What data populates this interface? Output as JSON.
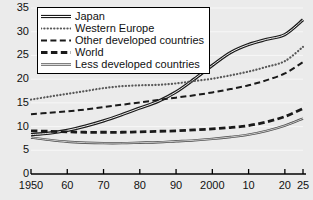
{
  "chart_data": {
    "type": "line",
    "title": "",
    "subtitle": "",
    "xlabel": "",
    "ylabel": "",
    "xlim": [
      1950,
      2025
    ],
    "ylim": [
      0,
      35
    ],
    "grid": true,
    "legend_position": "top-left",
    "y_ticks": [
      0,
      5,
      10,
      15,
      20,
      25,
      30,
      35
    ],
    "y_tick_labels": [
      "0",
      "5",
      "10",
      "15",
      "20",
      "25",
      "30",
      "35"
    ],
    "x_ticks": [
      1950,
      1960,
      1970,
      1980,
      1990,
      2000,
      2010,
      2020,
      2025
    ],
    "x_tick_labels": [
      "1950",
      "60",
      "70",
      "80",
      "90",
      "2000",
      "10",
      "20",
      "25"
    ],
    "x": [
      1950,
      1955,
      1960,
      1965,
      1970,
      1975,
      1980,
      1985,
      1990,
      1995,
      2000,
      2005,
      2010,
      2015,
      2020,
      2025
    ],
    "series": [
      {
        "name": "Japan",
        "style": "double-solid",
        "color": "#1a1a1a",
        "values": [
          8.3,
          8.6,
          9.2,
          10.1,
          11.2,
          12.5,
          13.9,
          15.3,
          17.3,
          20.0,
          22.9,
          25.6,
          27.3,
          28.4,
          29.4,
          32.5
        ]
      },
      {
        "name": "Western Europe",
        "style": "dotted",
        "color": "#4d4d4d",
        "values": [
          15.7,
          16.3,
          16.9,
          17.5,
          18.1,
          18.5,
          18.7,
          18.8,
          19.1,
          19.6,
          20.1,
          20.8,
          21.6,
          22.6,
          23.8,
          26.8
        ]
      },
      {
        "name": "Other developed countries",
        "style": "dashed",
        "color": "#1a1a1a",
        "values": [
          12.6,
          12.9,
          13.2,
          13.6,
          14.1,
          14.6,
          15.1,
          15.6,
          16.1,
          16.6,
          17.2,
          17.9,
          18.7,
          19.8,
          21.2,
          23.6
        ]
      },
      {
        "name": "World",
        "style": "thick-dashed",
        "color": "#1a1a1a",
        "values": [
          9.1,
          9.0,
          8.9,
          8.8,
          8.8,
          8.8,
          8.9,
          9.0,
          9.1,
          9.3,
          9.5,
          9.8,
          10.2,
          11.0,
          12.1,
          13.8
        ]
      },
      {
        "name": "Less developed countries",
        "style": "double-thin",
        "color": "#4d4d4d",
        "values": [
          7.7,
          7.2,
          6.8,
          6.6,
          6.5,
          6.5,
          6.6,
          6.7,
          6.9,
          7.1,
          7.4,
          7.8,
          8.3,
          9.1,
          10.2,
          11.7
        ]
      }
    ]
  },
  "legend": {
    "items": [
      {
        "label": "Japan",
        "style": "double-solid"
      },
      {
        "label": "Western Europe",
        "style": "dotted"
      },
      {
        "label": "Other developed countries",
        "style": "dashed"
      },
      {
        "label": "World",
        "style": "thick-dashed"
      },
      {
        "label": "Less developed countries",
        "style": "double-thin"
      }
    ]
  },
  "colors": {
    "background": "#ebebeb",
    "gridline": "#f7f7f7",
    "axis": "#000000",
    "text": "#111111",
    "legend_background": "#ffffff",
    "legend_border": "#000000"
  }
}
